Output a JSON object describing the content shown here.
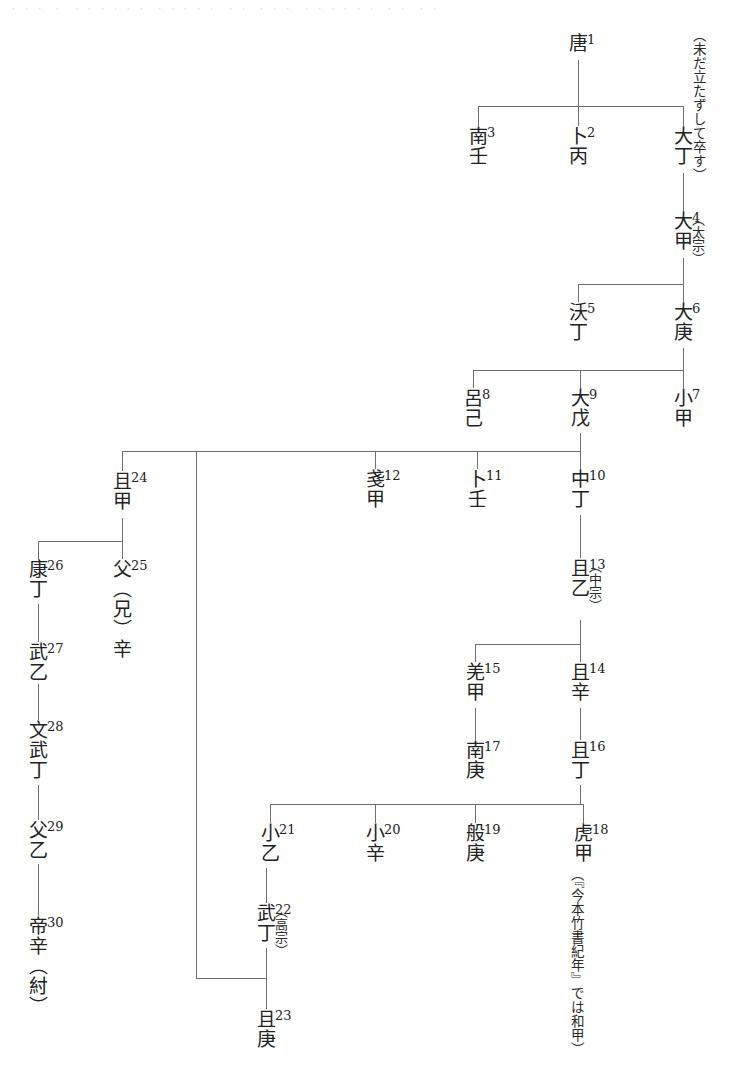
{
  "diagram": {
    "title_artifact": "・・・ ・ ・・・・・・ ・・・・・ ・・ ・・・ ・・・・・・ ・・ ・・",
    "type": "genealogy-tree",
    "line_color": "#6d6f73",
    "text_color": "#222222",
    "nodes": [
      {
        "id": "n1",
        "num": "1",
        "name": "唐",
        "ann": ""
      },
      {
        "id": "n2",
        "num": "2",
        "name": "卜丙",
        "ann": ""
      },
      {
        "id": "n3",
        "num": "3",
        "name": "南壬",
        "ann": ""
      },
      {
        "id": "n_dating",
        "num": "",
        "name": "大丁",
        "ann": "（未だ立たずして卒す）"
      },
      {
        "id": "n4",
        "num": "4",
        "name": "大甲",
        "ann": "（太宗）"
      },
      {
        "id": "n5",
        "num": "5",
        "name": "沃丁",
        "ann": ""
      },
      {
        "id": "n6",
        "num": "6",
        "name": "大庚",
        "ann": ""
      },
      {
        "id": "n7",
        "num": "7",
        "name": "小甲",
        "ann": ""
      },
      {
        "id": "n8",
        "num": "8",
        "name": "呂己",
        "ann": ""
      },
      {
        "id": "n9",
        "num": "9",
        "name": "大戊",
        "ann": ""
      },
      {
        "id": "n10",
        "num": "10",
        "name": "中丁",
        "ann": ""
      },
      {
        "id": "n11",
        "num": "11",
        "name": "卜壬",
        "ann": ""
      },
      {
        "id": "n12",
        "num": "12",
        "name": "戔甲",
        "ann": ""
      },
      {
        "id": "n13",
        "num": "13",
        "name": "且乙",
        "ann": "（中宗）"
      },
      {
        "id": "n14",
        "num": "14",
        "name": "且辛",
        "ann": ""
      },
      {
        "id": "n15",
        "num": "15",
        "name": "羌甲",
        "ann": ""
      },
      {
        "id": "n16",
        "num": "16",
        "name": "且丁",
        "ann": ""
      },
      {
        "id": "n17",
        "num": "17",
        "name": "南庚",
        "ann": ""
      },
      {
        "id": "n18",
        "num": "18",
        "name": "虎甲",
        "ann": "（『今本竹書紀年』では和甲）"
      },
      {
        "id": "n19",
        "num": "19",
        "name": "般庚",
        "ann": ""
      },
      {
        "id": "n20",
        "num": "20",
        "name": "小辛",
        "ann": ""
      },
      {
        "id": "n21",
        "num": "21",
        "name": "小乙",
        "ann": ""
      },
      {
        "id": "n22",
        "num": "22",
        "name": "武丁",
        "ann": "（高宗）"
      },
      {
        "id": "n23",
        "num": "23",
        "name": "且庚",
        "ann": ""
      },
      {
        "id": "n24",
        "num": "24",
        "name": "且甲",
        "ann": ""
      },
      {
        "id": "n25",
        "num": "25",
        "name": "父（兄）辛",
        "ann": ""
      },
      {
        "id": "n26",
        "num": "26",
        "name": "康丁",
        "ann": ""
      },
      {
        "id": "n27",
        "num": "27",
        "name": "武乙",
        "ann": ""
      },
      {
        "id": "n28",
        "num": "28",
        "name": "文武丁",
        "ann": ""
      },
      {
        "id": "n29",
        "num": "29",
        "name": "父乙",
        "ann": ""
      },
      {
        "id": "n30",
        "num": "30",
        "name": "帝辛（紂）",
        "ann": ""
      }
    ]
  }
}
